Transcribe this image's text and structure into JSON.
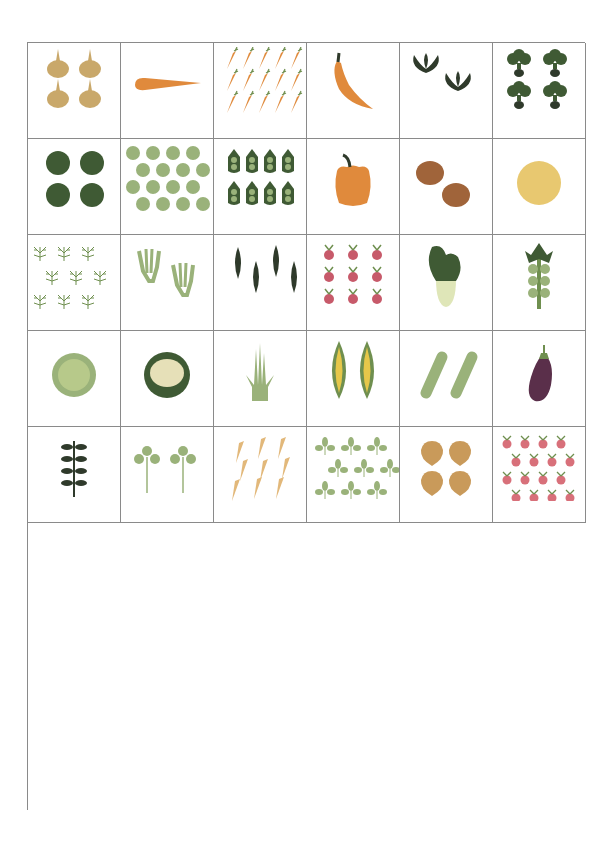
{
  "colors": {
    "grid_line": "#8a8a8a",
    "light_green": "#9ab27a",
    "mid_green": "#6f8f4f",
    "dark_green": "#3f5a34",
    "very_dark": "#2f3a2b",
    "orange": "#e08a3c",
    "yellow": "#e6c74a",
    "red": "#d9533a",
    "purple": "#5a2f4a",
    "tan": "#c9a86a",
    "pale": "#dfe6b8"
  },
  "plants": [
    {
      "name": "Garlic",
      "count": "4",
      "icon": "garlic-icon"
    },
    {
      "name": "Okra",
      "count": "1",
      "icon": "okra-icon"
    },
    {
      "name": "Carrots",
      "count": "16",
      "icon": "carrots-icon"
    },
    {
      "name": "Hot Peppers",
      "count": "1",
      "icon": "hot-pepper-icon"
    },
    {
      "name": "Kale",
      "count": "2",
      "icon": "kale-icon"
    },
    {
      "name": "Kohlrabi",
      "count": "4",
      "icon": "kohlrabi-icon"
    },
    {
      "name": "Head Lettuce",
      "count": "4",
      "icon": "head-lettuce-icon"
    },
    {
      "name": "Leaf Lettuce",
      "count": "16",
      "icon": "leaf-lettuce-icon"
    },
    {
      "name": "Peas",
      "count": "8",
      "icon": "peas-icon"
    },
    {
      "name": "Bell Peppers",
      "count": "1",
      "icon": "bell-pepper-icon"
    },
    {
      "name": "Potatoes",
      "count": "2",
      "icon": "potatoes-icon"
    },
    {
      "name": "Melons",
      "count": "1",
      "icon": "melon-icon"
    },
    {
      "name": "Dill",
      "count": "9",
      "icon": "dill-icon"
    },
    {
      "name": "Fennel",
      "count": "2",
      "icon": "fennel-icon"
    },
    {
      "name": "Green Beans",
      "count": "4",
      "icon": "green-beans-icon"
    },
    {
      "name": "Beets",
      "count": "9",
      "icon": "beets-icon"
    },
    {
      "name": "Bok Choi",
      "count": "1",
      "icon": "bok-choi-icon"
    },
    {
      "name": "Brussels Sprouts",
      "count": "1",
      "icon": "brussels-sprouts-icon"
    },
    {
      "name": "Cabbage",
      "count": "1",
      "icon": "cabbage-icon"
    },
    {
      "name": "Cauliflower",
      "count": "1",
      "icon": "cauliflower-icon"
    },
    {
      "name": "Chives",
      "count": "1",
      "icon": "chives-icon"
    },
    {
      "name": "Corn",
      "count": "2",
      "icon": "corn-icon"
    },
    {
      "name": "Cucumbers",
      "count": "2",
      "icon": "cucumbers-icon"
    },
    {
      "name": "Eggplant",
      "count": "1",
      "icon": "eggplant-icon"
    },
    {
      "name": "Oregano",
      "count": "1",
      "icon": "oregano-icon"
    },
    {
      "name": "Parsley",
      "count": "2",
      "icon": "parsley-icon"
    },
    {
      "name": "Parsnips",
      "count": "9",
      "icon": "parsnips-icon"
    },
    {
      "name": "Cilantro",
      "count": "9",
      "icon": "cilantro-icon"
    },
    {
      "name": "Rutabagas",
      "count": "4",
      "icon": "rutabagas-icon"
    },
    {
      "name": "Radishes",
      "count": "16",
      "icon": "radishes-icon"
    },
    {
      "name": "Rosemary",
      "count": "1",
      "icon": "rosemary-icon"
    },
    {
      "name": "Pumpkins",
      "count": "1",
      "icon": "pumpkin-icon"
    },
    {
      "name": "Sage",
      "count": "1",
      "icon": "sage-icon"
    },
    {
      "name": "Basil",
      "count": "2",
      "icon": "basil-icon"
    },
    {
      "name": "Arugula",
      "count": "9",
      "icon": "arugula-icon"
    },
    {
      "name": "Spinach",
      "count": "9",
      "icon": "spinach-icon"
    },
    {
      "name": "Summer Squash",
      "count": "1",
      "icon": "summer-squash-icon"
    },
    {
      "name": "Sweet Potatoes",
      "count": "1",
      "icon": "sweet-potato-icon"
    },
    {
      "name": "Swiss Chard",
      "count": "4",
      "icon": "swiss-chard-icon"
    },
    {
      "name": "Thyme",
      "count": "4",
      "icon": "thyme-icon"
    },
    {
      "name": "Onions",
      "count": "9",
      "icon": "onions-icon"
    },
    {
      "name": "Turnips",
      "count": "9",
      "icon": "turnips-icon"
    },
    {
      "name": "Winter Squash",
      "count": "1",
      "icon": "winter-squash-icon"
    },
    {
      "name": "Leeks",
      "count": "6",
      "icon": "leeks-icon"
    },
    {
      "name": "Celery",
      "count": "2",
      "icon": "celery-icon"
    },
    {
      "name": "Calendula",
      "count": "2",
      "icon": "calendula-icon"
    },
    {
      "name": "Broccoli",
      "count": "1",
      "icon": "broccoli-icon"
    },
    {
      "name": "Tomato",
      "count": "1",
      "icon": "tomato-icon"
    }
  ]
}
